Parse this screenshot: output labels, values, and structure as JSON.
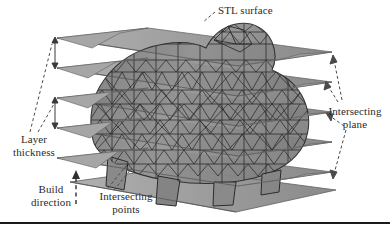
{
  "figure": {
    "domain": "diagram",
    "width": 390,
    "height": 236,
    "background_color": "#ffffff"
  },
  "labels": {
    "stl_surface": "STL surface",
    "layer_thickness": "Layer\nthickness",
    "build_direction": "Build\ndirection",
    "intersecting_points": "Intersecting\npoints",
    "intersecting_plane": "Intersecting\nplane"
  },
  "colors": {
    "plane_top_face": "#9a9a9a",
    "plane_under_face": "#878787",
    "plane_edge": "#5a5a5a",
    "mesh_fill": "#8f8f8f",
    "mesh_edge": "#2e2e2e",
    "label_text": "#2b2b2b",
    "leader_line": "#4a4a4a",
    "rule": "#1a1a1a"
  },
  "geometry": {
    "plane_count": 6,
    "plane_shape": "parallelogram",
    "plane_layer_gap_px": 30,
    "model": "triangulated pig mesh",
    "build_direction_axis": "vertical-up"
  },
  "annotations": {
    "layer_thickness_arrows": 2,
    "plane_leaders": 4,
    "stl_leader": 1,
    "points_leader": 1,
    "build_arrow": "dashed up arrow"
  }
}
